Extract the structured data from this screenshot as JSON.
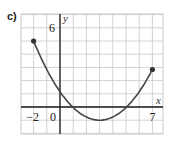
{
  "panel_label": "c)",
  "chart_data": {
    "type": "line",
    "title": "",
    "xlabel": "x",
    "ylabel": "y",
    "xlim": [
      -3,
      8
    ],
    "ylim": [
      -2,
      7
    ],
    "grid": true,
    "x_tick_labels": [
      "-2",
      "0",
      "7"
    ],
    "y_tick_labels": [
      "6"
    ],
    "curve": "parabola",
    "endpoints": [
      {
        "x": -2,
        "y": 5
      },
      {
        "x": 7,
        "y": 3
      }
    ],
    "vertex": {
      "x": 3,
      "y": -1
    },
    "y_intercept": 1.2,
    "x_intercepts": [
      1,
      5
    ],
    "series": [
      {
        "name": "f(x)",
        "x": [
          -2,
          -1,
          0,
          1,
          2,
          3,
          4,
          5,
          6,
          7
        ],
        "y": [
          5,
          3.6,
          1.2,
          0,
          -0.8,
          -1,
          -0.8,
          0,
          1.2,
          3
        ]
      }
    ]
  },
  "colors": {
    "grid": "#c8c8c8",
    "axis": "#1a1a1a",
    "curve": "#444444"
  }
}
